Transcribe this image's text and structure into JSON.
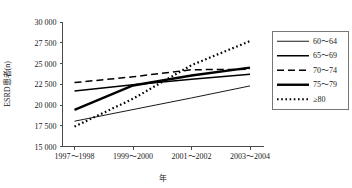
{
  "chart_data": {
    "type": "line",
    "title": "",
    "xlabel": "年",
    "ylabel": "ESRD患者(n)",
    "categories": [
      "1997～1998",
      "1999～2000",
      "2001～2002",
      "2003～2004"
    ],
    "ylim": [
      15000,
      30000
    ],
    "yticks": [
      15000,
      17500,
      20000,
      22500,
      25000,
      27500,
      30000
    ],
    "ytick_labels": [
      "15 000",
      "17 500",
      "20 000",
      "22 500",
      "25 000",
      "27 500",
      "30 000"
    ],
    "grid": false,
    "legend_position": "right",
    "series": [
      {
        "name": "60～64",
        "label": "60～64",
        "style": "solid-thin",
        "dash": "none",
        "width": 0.9,
        "color": "#000000",
        "values": [
          18050,
          19450,
          20850,
          22300
        ]
      },
      {
        "name": "65～69",
        "label": "65～69",
        "style": "solid-medium",
        "dash": "none",
        "width": 1.5,
        "color": "#000000",
        "values": [
          21700,
          22450,
          23100,
          23700
        ]
      },
      {
        "name": "70～74",
        "label": "70～74",
        "style": "dashed",
        "dash": "7,4",
        "width": 1.5,
        "color": "#000000",
        "values": [
          22700,
          23400,
          24250,
          24300
        ]
      },
      {
        "name": "75～79",
        "label": "75～79",
        "style": "solid-thick",
        "dash": "none",
        "width": 2.4,
        "color": "#000000",
        "values": [
          19400,
          22350,
          23550,
          24500
        ]
      },
      {
        "name": "≥80",
        "label": "≥80",
        "style": "dotted",
        "dash": "1.6,2.6",
        "width": 2.2,
        "color": "#000000",
        "values": [
          17400,
          20750,
          24800,
          27700
        ]
      }
    ]
  },
  "legend": {
    "items": [
      "60～64",
      "65～69",
      "70～74",
      "75～79",
      "≥80"
    ]
  }
}
